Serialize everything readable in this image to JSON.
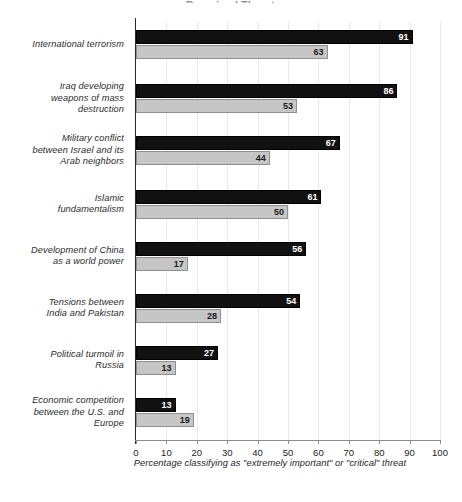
{
  "chart_data": {
    "type": "bar",
    "orientation": "horizontal",
    "title": "Perceived Threats",
    "title_clipped": true,
    "categories": [
      "International terrorism",
      "Iraq developing weapons of mass destruction",
      "Military conflict between Israel and its Arab neighbors",
      "Islamic fundamentalism",
      "Development of China as a world power",
      "Tensions between India and Pakistan",
      "Political turmoil in Russia",
      "Economic competition between the U.S. and Europe"
    ],
    "category_lines": [
      [
        "International terrorism"
      ],
      [
        "Iraq developing",
        "weapons of mass",
        "destruction"
      ],
      [
        "Military conflict",
        "between Israel and its",
        "Arab neighbors"
      ],
      [
        "Islamic",
        "fundamentalism"
      ],
      [
        "Development of China",
        "as a world power"
      ],
      [
        "Tensions between",
        "India and Pakistan"
      ],
      [
        "Political turmoil in",
        "Russia"
      ],
      [
        "Economic competition",
        "between the U.S. and",
        "Europe"
      ]
    ],
    "series": [
      {
        "name": "series-dark",
        "color": "#111111",
        "values": [
          91,
          86,
          67,
          61,
          56,
          54,
          27,
          13
        ]
      },
      {
        "name": "series-light",
        "color": "#c6c6c6",
        "values": [
          63,
          53,
          44,
          50,
          17,
          28,
          13,
          19
        ]
      }
    ],
    "xlabel": "Percentage classifying as \"extremely important\" or \"critical\" threat",
    "ylabel": "",
    "xlim": [
      0,
      100
    ],
    "xticks": [
      0,
      10,
      20,
      30,
      40,
      50,
      60,
      70,
      80,
      90,
      100
    ],
    "grid": "vertical",
    "legend": "none"
  }
}
